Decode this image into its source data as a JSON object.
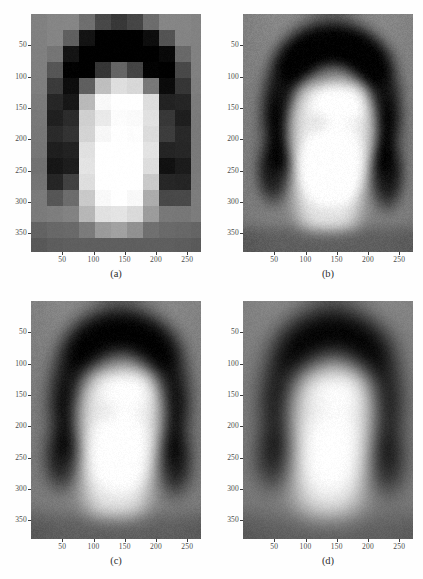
{
  "figure": {
    "type": "image-grid",
    "layout": "2x2",
    "panel_count": 4,
    "background_color": "#ffffff",
    "image_background_gray": "#8a8a8a"
  },
  "axes_common": {
    "x_ticks": [
      "50",
      "100",
      "150",
      "200",
      "250"
    ],
    "y_ticks": [
      "50",
      "100",
      "150",
      "200",
      "250",
      "300",
      "350"
    ],
    "x_tick_values": [
      50,
      100,
      150,
      200,
      250
    ],
    "y_tick_values": [
      50,
      100,
      150,
      200,
      250,
      300,
      350
    ],
    "x_range": [
      0,
      272
    ],
    "y_range": [
      0,
      380
    ],
    "tick_color": "#4a4a4a"
  },
  "panels": [
    {
      "id": "a",
      "caption": "(a)",
      "description": "low-resolution blocky face image",
      "blur": 0,
      "pixelated": true,
      "block_size": 16,
      "noise": 0.02
    },
    {
      "id": "b",
      "caption": "(b)",
      "description": "reconstructed face image, moderate detail",
      "blur": 2.2,
      "pixelated": false,
      "block_size": 4,
      "noise": 0.05
    },
    {
      "id": "c",
      "caption": "(c)",
      "description": "reconstructed face image, smoother",
      "blur": 3.4,
      "pixelated": false,
      "block_size": 4,
      "noise": 0.045
    },
    {
      "id": "d",
      "caption": "(d)",
      "description": "reconstructed face image, most blurred",
      "blur": 5.0,
      "pixelated": false,
      "block_size": 4,
      "noise": 0.04
    }
  ],
  "chart_data": {
    "type": "heatmap",
    "title": "",
    "xlabel": "",
    "ylabel": "",
    "colormap": "gray",
    "panel_ids": [
      "a",
      "b",
      "c",
      "d"
    ],
    "image_width_px": 272,
    "image_height_px": 380,
    "xlim": [
      0,
      272
    ],
    "ylim": [
      0,
      380
    ],
    "grid": false,
    "legend": "none",
    "note": "Four grayscale renderings of the same portrait at increasing smoothness / resolution."
  },
  "footer": {
    "text": ""
  }
}
